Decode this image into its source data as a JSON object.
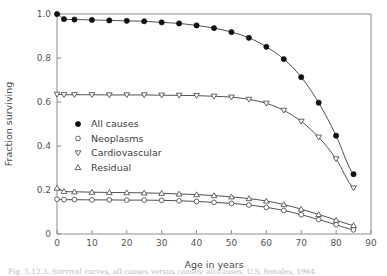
{
  "figure": {
    "caption": "Fig. 5.12.3. Survival curves, all-causes versus causes: all-causes, U.S. females, 1964."
  },
  "chart_data": {
    "type": "line",
    "title": "",
    "xlabel": "Age in years",
    "ylabel": "Fraction surviving",
    "xlim": [
      0,
      90
    ],
    "ylim": [
      0,
      1.0
    ],
    "xticks": [
      0,
      10,
      20,
      30,
      40,
      50,
      60,
      70,
      80,
      90
    ],
    "xtick_labels": [
      "0",
      "10",
      "20",
      "30",
      "40",
      "50",
      "60",
      "70",
      "80",
      "90"
    ],
    "yticks": [
      0,
      0.2,
      0.4,
      0.6,
      0.8,
      1.0
    ],
    "ytick_labels": [
      "0",
      "0.2",
      "0.4",
      "0.6",
      "0.8",
      "1.0"
    ],
    "grid": false,
    "legend_position": "center-left",
    "x": [
      0,
      2,
      5,
      10,
      15,
      20,
      25,
      30,
      35,
      40,
      45,
      50,
      55,
      60,
      65,
      70,
      75,
      80,
      85
    ],
    "series": [
      {
        "name": "All causes",
        "marker": "filled-circle",
        "values": [
          1.0,
          0.977,
          0.975,
          0.973,
          0.971,
          0.969,
          0.967,
          0.962,
          0.957,
          0.948,
          0.936,
          0.918,
          0.892,
          0.851,
          0.795,
          0.713,
          0.597,
          0.447,
          0.272
        ]
      },
      {
        "name": "Cardiovascular",
        "marker": "open-triangle-down",
        "values": [
          0.635,
          0.633,
          0.633,
          0.633,
          0.632,
          0.632,
          0.632,
          0.631,
          0.63,
          0.629,
          0.626,
          0.622,
          0.612,
          0.594,
          0.562,
          0.512,
          0.44,
          0.341,
          0.209
        ]
      },
      {
        "name": "Residual",
        "marker": "open-triangle-up",
        "values": [
          0.209,
          0.194,
          0.192,
          0.19,
          0.189,
          0.188,
          0.187,
          0.185,
          0.182,
          0.179,
          0.175,
          0.169,
          0.161,
          0.15,
          0.134,
          0.113,
          0.089,
          0.063,
          0.039
        ]
      },
      {
        "name": "Neoplasms",
        "marker": "open-circle",
        "values": [
          0.158,
          0.156,
          0.156,
          0.155,
          0.155,
          0.154,
          0.154,
          0.153,
          0.151,
          0.148,
          0.144,
          0.139,
          0.132,
          0.121,
          0.107,
          0.088,
          0.066,
          0.042,
          0.019
        ]
      }
    ],
    "legend": [
      {
        "label": "All causes",
        "marker": "filled-circle"
      },
      {
        "label": "Neoplasms",
        "marker": "open-circle"
      },
      {
        "label": "Cardiovascular",
        "marker": "open-triangle-down"
      },
      {
        "label": "Residual",
        "marker": "open-triangle-up"
      }
    ],
    "colors": {
      "line": "#3d3d3d",
      "marker_fill_open": "#ffffff",
      "marker_stroke": "#4a4a4a",
      "marker_filled": "#111111",
      "axis": "#8d8d8d",
      "text": "#555555"
    }
  }
}
